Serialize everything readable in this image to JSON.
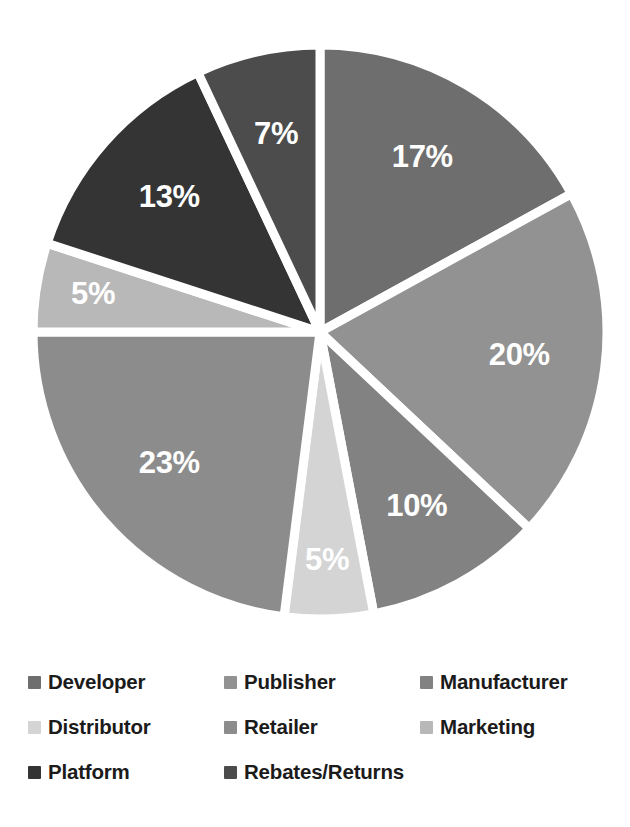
{
  "chart_data": {
    "type": "pie",
    "title": "",
    "subtitle": "",
    "xlabel": "",
    "ylabel": "",
    "grid": false,
    "legend_position": "bottom",
    "start_angle_deg": 0,
    "direction": "clockwise",
    "categories": [
      "Developer",
      "Publisher",
      "Manufacturer",
      "Distributor",
      "Retailer",
      "Marketing",
      "Platform",
      "Rebates/Returns"
    ],
    "values": [
      17,
      20,
      10,
      5,
      23,
      5,
      13,
      7
    ],
    "value_labels": [
      "17%",
      "20%",
      "10%",
      "5%",
      "23%",
      "5%",
      "13%",
      "7%"
    ],
    "colors": [
      "#6e6e6e",
      "#929292",
      "#828282",
      "#d4d4d4",
      "#8c8c8c",
      "#b8b8b8",
      "#343434",
      "#4c4c4c"
    ],
    "slice_label_color": "#ffffff",
    "separator_color": "#ffffff",
    "total": 100,
    "units": "percent"
  },
  "legend": {
    "items": [
      {
        "label": "Developer",
        "color": "#6e6e6e",
        "value_label": "17%"
      },
      {
        "label": "Publisher",
        "color": "#929292",
        "value_label": "20%"
      },
      {
        "label": "Manufacturer",
        "color": "#828282",
        "value_label": "10%"
      },
      {
        "label": "Distributor",
        "color": "#d4d4d4",
        "value_label": "5%"
      },
      {
        "label": "Retailer",
        "color": "#8c8c8c",
        "value_label": "23%"
      },
      {
        "label": "Marketing",
        "color": "#b8b8b8",
        "value_label": "5%"
      },
      {
        "label": "Platform",
        "color": "#343434",
        "value_label": "13%"
      },
      {
        "label": "Rebates/Returns",
        "color": "#4c4c4c",
        "value_label": "7%"
      }
    ]
  },
  "canvas": {
    "background": "#ffffff",
    "center_x": 320,
    "center_y": 332,
    "radius": 287
  }
}
